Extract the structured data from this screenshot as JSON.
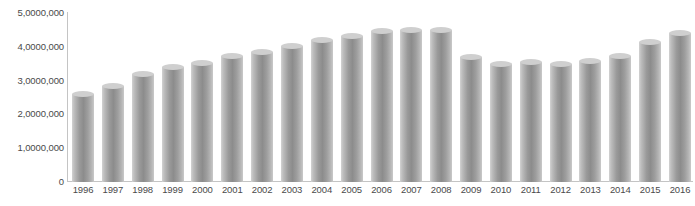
{
  "chart_data": {
    "type": "bar",
    "title": "",
    "xlabel": "",
    "ylabel": "",
    "ylim": [
      0,
      50000000
    ],
    "grid": false,
    "legend": null,
    "y_tick_labels": [
      "5,0000,000",
      "4,0000,000",
      "3,0000,000",
      "2,0000,000",
      "1,0000,000",
      "0"
    ],
    "y_tick_values": [
      50000000,
      40000000,
      30000000,
      20000000,
      10000000,
      0
    ],
    "categories": [
      "1996",
      "1997",
      "1998",
      "1999",
      "2000",
      "2001",
      "2002",
      "2003",
      "2004",
      "2005",
      "2006",
      "2007",
      "2008",
      "2009",
      "2010",
      "2011",
      "2012",
      "2013",
      "2014",
      "2015",
      "2016"
    ],
    "values": [
      26000000,
      28400000,
      31900000,
      33900000,
      35300000,
      37300000,
      38600000,
      40100000,
      41900000,
      43200000,
      44600000,
      44900000,
      44900000,
      36900000,
      34800000,
      35500000,
      34800000,
      35800000,
      37300000,
      41300000,
      44100000
    ],
    "series_color": "#9a9a9a",
    "axis_color": "#c4c4c4",
    "label_color": "#4a4a4a",
    "background": "#ffffff"
  }
}
